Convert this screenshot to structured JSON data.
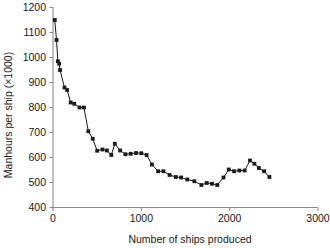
{
  "chart_data": {
    "type": "line",
    "title": "",
    "xlabel": "Number of ships produced",
    "ylabel": "Manhours per ship (×1000)",
    "xlim": [
      0,
      3000
    ],
    "ylim": [
      400,
      1200
    ],
    "xticks": [
      0,
      1000,
      2000,
      3000
    ],
    "xtick_labels": [
      "0",
      "1000",
      "2000",
      "3000"
    ],
    "yticks": [
      400,
      500,
      600,
      700,
      800,
      900,
      1000,
      1100,
      1200
    ],
    "ytick_labels": [
      "400",
      "500",
      "600",
      "700",
      "800",
      "900",
      "1000",
      "1100",
      "1200"
    ],
    "grid": false,
    "legend": null,
    "marker": "square",
    "marker_color": "#1a1a1a",
    "line_color": "#1a1a1a",
    "series": [
      {
        "name": "Manhours per ship",
        "x": [
          20,
          40,
          55,
          70,
          80,
          130,
          160,
          200,
          240,
          300,
          350,
          400,
          450,
          500,
          560,
          610,
          660,
          700,
          760,
          820,
          880,
          940,
          1000,
          1060,
          1120,
          1190,
          1250,
          1320,
          1390,
          1450,
          1520,
          1600,
          1680,
          1740,
          1800,
          1860,
          1930,
          1990,
          2050,
          2110,
          2170,
          2230,
          2280,
          2330,
          2390,
          2450
        ],
        "y": [
          1150,
          1070,
          985,
          975,
          950,
          880,
          870,
          820,
          815,
          800,
          800,
          705,
          675,
          627,
          632,
          628,
          610,
          655,
          628,
          613,
          615,
          618,
          617,
          610,
          572,
          545,
          545,
          530,
          522,
          520,
          512,
          505,
          490,
          498,
          495,
          490,
          520,
          552,
          545,
          548,
          548,
          588,
          575,
          558,
          545,
          522
        ]
      }
    ]
  },
  "axes": {
    "x_axis_name": "x-axis",
    "y_axis_name": "y-axis"
  }
}
